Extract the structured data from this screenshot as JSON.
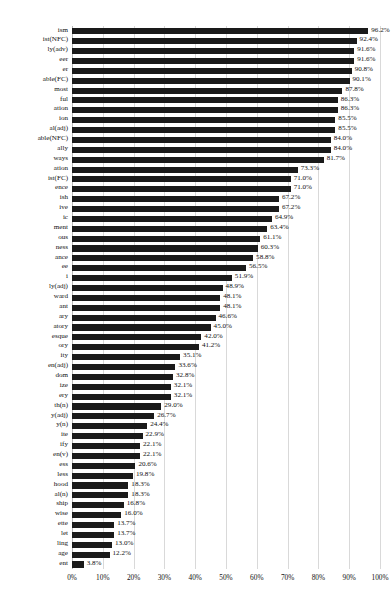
{
  "chart_data": {
    "type": "bar",
    "orientation": "horizontal",
    "title": "",
    "subtitle": "",
    "xlabel": "",
    "ylabel": "",
    "xlim": [
      0,
      100
    ],
    "xticks": [
      "0%",
      "10%",
      "20%",
      "30%",
      "40%",
      "50%",
      "60%",
      "70%",
      "80%",
      "90%",
      "100%"
    ],
    "xtick_values": [
      0,
      10,
      20,
      30,
      40,
      50,
      60,
      70,
      80,
      90,
      100
    ],
    "grid": "vertical",
    "legend": "none",
    "bar_color": "#1a1a1a",
    "value_suffix": "%",
    "categories": [
      "ism",
      "ist(NFC)",
      "ly(adv)",
      "eer",
      "er",
      "able(FC)",
      "most",
      "ful",
      "ation",
      "ion",
      "al(adj)",
      "able(NFC)",
      "ally",
      "ways",
      "ation",
      "ist(FC)",
      "ence",
      "ish",
      "ive",
      "ic",
      "ment",
      "ous",
      "ness",
      "ance",
      "ee",
      "i",
      "ly(adj)",
      "ward",
      "ant",
      "ary",
      "atory",
      "esque",
      "ory",
      "ity",
      "en(adj)",
      "dom",
      "ize",
      "ery",
      "th(n)",
      "y(adj)",
      "y(n)",
      "ite",
      "ify",
      "en(v)",
      "ess",
      "less",
      "hood",
      "al(n)",
      "ship",
      "wise",
      "ette",
      "let",
      "ling",
      "age",
      "ent"
    ],
    "values": [
      96.2,
      92.4,
      91.6,
      91.6,
      90.8,
      90.1,
      87.8,
      86.3,
      86.3,
      85.5,
      85.5,
      84.0,
      84.0,
      81.7,
      73.3,
      71.0,
      71.0,
      67.2,
      67.2,
      64.9,
      63.4,
      61.1,
      60.3,
      58.8,
      56.5,
      51.9,
      48.9,
      48.1,
      48.1,
      46.6,
      45.0,
      42.0,
      41.2,
      35.1,
      33.6,
      32.8,
      32.1,
      32.1,
      29.0,
      26.7,
      24.4,
      22.9,
      22.1,
      22.1,
      20.6,
      19.8,
      18.3,
      18.3,
      16.8,
      16.0,
      13.7,
      13.7,
      13.0,
      12.2,
      3.8
    ],
    "value_labels": [
      "96.2%",
      "92.4%",
      "91.6%",
      "91.6%",
      "90.8%",
      "90.1%",
      "87.8%",
      "86.3%",
      "86.3%",
      "85.5%",
      "85.5%",
      "84.0%",
      "84.0%",
      "81.7%",
      "73.3%",
      "71.0%",
      "71.0%",
      "67.2%",
      "67.2%",
      "64.9%",
      "63.4%",
      "61.1%",
      "60.3%",
      "58.8%",
      "56.5%",
      "51.9%",
      "48.9%",
      "48.1%",
      "48.1%",
      "46.6%",
      "45.0%",
      "42.0%",
      "41.2%",
      "35.1%",
      "33.6%",
      "32.8%",
      "32.1%",
      "32.1%",
      "29.0%",
      "26.7%",
      "24.4%",
      "22.9%",
      "22.1%",
      "22.1%",
      "20.6%",
      "19.8%",
      "18.3%",
      "18.3%",
      "16.8%",
      "16.0%",
      "13.7%",
      "13.7%",
      "13.0%",
      "12.2%",
      "3.8%"
    ]
  }
}
